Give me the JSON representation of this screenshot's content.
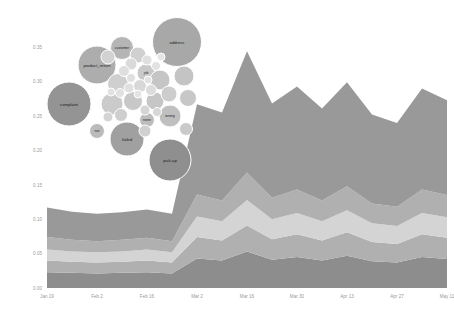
{
  "chart_data": [
    {
      "type": "area",
      "title": "",
      "subtitle": "",
      "xlabel": "",
      "ylabel": "",
      "stacked": true,
      "grid": false,
      "legend": "none",
      "ylim": [
        0.0,
        0.375
      ],
      "yticks": [
        "0.00",
        "0.05",
        "0.10",
        "0.15",
        "0.20",
        "0.25",
        "0.30",
        "0.35"
      ],
      "ytick_values": [
        0.0,
        0.05,
        0.1,
        0.15,
        0.2,
        0.25,
        0.3,
        0.35
      ],
      "categories": [
        "Jan 19",
        "Jan 26",
        "Feb 2",
        "Feb 9",
        "Feb 16",
        "Feb 23",
        "Mar 2",
        "Mar 9",
        "Mar 16",
        "Mar 23",
        "Mar 30",
        "Apr 6",
        "Apr 13",
        "Apr 20",
        "Apr 27",
        "May 4",
        "May 11"
      ],
      "xticks": [
        "Jan 19",
        "Feb 2",
        "Feb 16",
        "Mar 2",
        "Mar 16",
        "Mar 30",
        "Apr 13",
        "Apr 27",
        "May 11"
      ],
      "series": [
        {
          "name": "band-1",
          "color": "#999999",
          "values": [
            0.043,
            0.041,
            0.04,
            0.04,
            0.041,
            0.04,
            0.131,
            0.128,
            0.176,
            0.137,
            0.15,
            0.134,
            0.151,
            0.129,
            0.122,
            0.147,
            0.138
          ]
        },
        {
          "name": "band-2",
          "color": "#b0b0b0",
          "values": [
            0.018,
            0.017,
            0.016,
            0.017,
            0.017,
            0.016,
            0.032,
            0.03,
            0.04,
            0.031,
            0.034,
            0.03,
            0.035,
            0.029,
            0.028,
            0.034,
            0.032
          ]
        },
        {
          "name": "band-3",
          "color": "#d4d4d4",
          "values": [
            0.016,
            0.015,
            0.015,
            0.015,
            0.016,
            0.015,
            0.03,
            0.028,
            0.037,
            0.029,
            0.031,
            0.028,
            0.032,
            0.027,
            0.026,
            0.031,
            0.03
          ]
        },
        {
          "name": "band-4",
          "color": "#b0b0b0",
          "values": [
            0.017,
            0.016,
            0.016,
            0.016,
            0.017,
            0.016,
            0.031,
            0.029,
            0.038,
            0.03,
            0.033,
            0.029,
            0.034,
            0.028,
            0.027,
            0.033,
            0.031
          ]
        },
        {
          "name": "band-5",
          "color": "#8d8d8d",
          "values": [
            0.023,
            0.022,
            0.021,
            0.022,
            0.023,
            0.021,
            0.043,
            0.04,
            0.053,
            0.041,
            0.045,
            0.04,
            0.047,
            0.039,
            0.037,
            0.045,
            0.042
          ]
        }
      ]
    },
    {
      "type": "scatter",
      "title": "",
      "subtitle": "",
      "xlabel": "",
      "ylabel": "",
      "grid": false,
      "legend": "none",
      "nodes": [
        {
          "label": "address",
          "cx": 177,
          "cy": 42,
          "r": 24.5,
          "color": "#a8a8a8",
          "labeled": true
        },
        {
          "label": "product_return",
          "cx": 97,
          "cy": 65,
          "r": 19.0,
          "color": "#adadad",
          "labeled": true
        },
        {
          "label": "complaint",
          "cx": 69,
          "cy": 104,
          "r": 22.0,
          "color": "#949494",
          "labeled": true
        },
        {
          "label": "pick-up",
          "cx": 170,
          "cy": 160,
          "r": 21.0,
          "color": "#8f8f8f",
          "labeled": true
        },
        {
          "label": "failed",
          "cx": 127,
          "cy": 139,
          "r": 17.0,
          "color": "#a0a0a0",
          "labeled": true
        },
        {
          "label": "customer",
          "cx": 122,
          "cy": 48,
          "r": 11.5,
          "color": "#b5b5b5",
          "labeled": true
        },
        {
          "label": "job",
          "cx": 146,
          "cy": 73,
          "r": 9.0,
          "color": "#c9c9c9",
          "labeled": true
        },
        {
          "label": "wrong",
          "cx": 170,
          "cy": 116,
          "r": 11.0,
          "color": "#bfbfbf",
          "labeled": true
        },
        {
          "label": "none",
          "cx": 147,
          "cy": 120,
          "r": 7.5,
          "color": "#bdbdbd",
          "labeled": true
        },
        {
          "label": "not",
          "cx": 97,
          "cy": 131,
          "r": 7.5,
          "color": "#bbbbbb",
          "labeled": true
        },
        {
          "label": "",
          "cx": 138,
          "cy": 55,
          "r": 8.0,
          "color": "#d0d0d0",
          "labeled": false
        },
        {
          "label": "",
          "cx": 160,
          "cy": 80,
          "r": 10.0,
          "color": "#c5c5c5",
          "labeled": false
        },
        {
          "label": "",
          "cx": 118,
          "cy": 84,
          "r": 10.5,
          "color": "#cfcfcf",
          "labeled": false
        },
        {
          "label": "",
          "cx": 112,
          "cy": 104,
          "r": 11.0,
          "color": "#cbcbcb",
          "labeled": false
        },
        {
          "label": "",
          "cx": 133,
          "cy": 101,
          "r": 9.5,
          "color": "#c8c8c8",
          "labeled": false
        },
        {
          "label": "",
          "cx": 155,
          "cy": 101,
          "r": 9.0,
          "color": "#c6c6c6",
          "labeled": false
        },
        {
          "label": "",
          "cx": 169,
          "cy": 94,
          "r": 8.0,
          "color": "#cdcdcd",
          "labeled": false
        },
        {
          "label": "",
          "cx": 131,
          "cy": 64,
          "r": 6.0,
          "color": "#dadada",
          "labeled": false
        },
        {
          "label": "",
          "cx": 124,
          "cy": 71,
          "r": 5.5,
          "color": "#dedede",
          "labeled": false
        },
        {
          "label": "",
          "cx": 140,
          "cy": 86,
          "r": 6.5,
          "color": "#d8d8d8",
          "labeled": false
        },
        {
          "label": "",
          "cx": 129,
          "cy": 88,
          "r": 5.0,
          "color": "#e0e0e0",
          "labeled": false
        },
        {
          "label": "",
          "cx": 151,
          "cy": 90,
          "r": 5.5,
          "color": "#dcdcdc",
          "labeled": false
        },
        {
          "label": "",
          "cx": 147,
          "cy": 60,
          "r": 5.0,
          "color": "#dfdfdf",
          "labeled": false
        },
        {
          "label": "",
          "cx": 156,
          "cy": 66,
          "r": 4.5,
          "color": "#e2e2e2",
          "labeled": false
        },
        {
          "label": "",
          "cx": 120,
          "cy": 93,
          "r": 4.5,
          "color": "#e1e1e1",
          "labeled": false
        },
        {
          "label": "",
          "cx": 138,
          "cy": 94,
          "r": 4.0,
          "color": "#e4e4e4",
          "labeled": false
        },
        {
          "label": "",
          "cx": 148,
          "cy": 80,
          "r": 4.0,
          "color": "#e3e3e3",
          "labeled": false
        },
        {
          "label": "",
          "cx": 131,
          "cy": 78,
          "r": 4.5,
          "color": "#e0e0e0",
          "labeled": false
        },
        {
          "label": "",
          "cx": 161,
          "cy": 57,
          "r": 4.0,
          "color": "#e5e5e5",
          "labeled": false
        },
        {
          "label": "",
          "cx": 111,
          "cy": 92,
          "r": 4.0,
          "color": "#e2e2e2",
          "labeled": false
        },
        {
          "label": "",
          "cx": 145,
          "cy": 110,
          "r": 5.0,
          "color": "#d5d5d5",
          "labeled": false
        },
        {
          "label": "",
          "cx": 157,
          "cy": 112,
          "r": 4.5,
          "color": "#d7d7d7",
          "labeled": false
        },
        {
          "label": "",
          "cx": 121,
          "cy": 115,
          "r": 6.5,
          "color": "#cecece",
          "labeled": false
        },
        {
          "label": "",
          "cx": 108,
          "cy": 117,
          "r": 5.0,
          "color": "#d4d4d4",
          "labeled": false
        },
        {
          "label": "",
          "cx": 184,
          "cy": 76,
          "r": 10.0,
          "color": "#c4c4c4",
          "labeled": false
        },
        {
          "label": "",
          "cx": 188,
          "cy": 98,
          "r": 8.5,
          "color": "#c7c7c7",
          "labeled": false
        },
        {
          "label": "",
          "cx": 108,
          "cy": 57,
          "r": 7.0,
          "color": "#d2d2d2",
          "labeled": false
        },
        {
          "label": "",
          "cx": 145,
          "cy": 131,
          "r": 6.0,
          "color": "#d0d0d0",
          "labeled": false
        },
        {
          "label": "",
          "cx": 186,
          "cy": 129,
          "r": 6.5,
          "color": "#cacaca",
          "labeled": false
        }
      ]
    }
  ],
  "axes": {
    "y_ticks": [
      "0.35",
      "0.30",
      "0.25",
      "0.20",
      "0.15",
      "0.10",
      "0.05",
      "0.00"
    ],
    "x_ticks": [
      "Jan 19",
      "Feb 2",
      "Feb 16",
      "Mar 2",
      "Mar 16",
      "Mar 30",
      "Apr 13",
      "Apr 27",
      "May 11"
    ]
  },
  "colors": {
    "background": "#ffffff",
    "band_dark": "#8d8d8d",
    "band_mid": "#b0b0b0",
    "band_light": "#d4d4d4",
    "band_top": "#999999",
    "tick_text": "#9a9a9a",
    "bubble_label": "#1c1c1c"
  }
}
